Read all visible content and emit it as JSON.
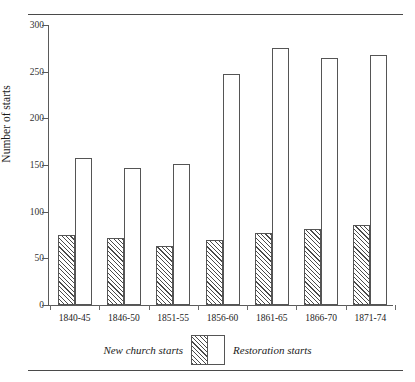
{
  "chart_data": {
    "type": "bar",
    "title": "",
    "subtitle": "",
    "xlabel": "",
    "ylabel": "Number of starts",
    "categories": [
      "1840-45",
      "1846-50",
      "1851-55",
      "1856-60",
      "1861-65",
      "1866-70",
      "1871-74"
    ],
    "series": [
      {
        "name": "New church starts",
        "style": "hatched",
        "values": [
          75,
          72,
          63,
          70,
          77,
          81,
          86
        ]
      },
      {
        "name": "Restoration starts",
        "style": "open",
        "values": [
          157,
          147,
          151,
          248,
          275,
          265,
          268
        ]
      }
    ],
    "ylim": [
      0,
      300
    ],
    "yticks": [
      0,
      50,
      100,
      150,
      200,
      250,
      300
    ],
    "ytick_labels": [
      "0",
      "50",
      "100",
      "150",
      "200",
      "250",
      "300"
    ],
    "grid": false,
    "legend_position": "bottom"
  },
  "legend": {
    "left_label": "New church starts",
    "right_label": "Restoration starts"
  },
  "colors": {
    "axis": "#5a5a5a",
    "rule": "#4a4a4a",
    "bar_outline": "#555555",
    "hatch": "#4a4a4a",
    "background": "#ffffff"
  }
}
